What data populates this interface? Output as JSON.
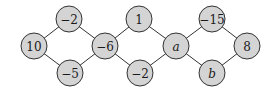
{
  "diagram": {
    "title": "",
    "node_fill": "#d4d4d4",
    "node_stroke": "#333333",
    "nodes": [
      {
        "id": "n10",
        "label": "10",
        "italic": false
      },
      {
        "id": "nm2a",
        "label": "−2",
        "italic": false
      },
      {
        "id": "nm5",
        "label": "−5",
        "italic": false
      },
      {
        "id": "nm6",
        "label": "−6",
        "italic": false
      },
      {
        "id": "n1",
        "label": "1",
        "italic": false
      },
      {
        "id": "nm2b",
        "label": "−2",
        "italic": false
      },
      {
        "id": "na",
        "label": "a",
        "italic": true
      },
      {
        "id": "nm15",
        "label": "−15",
        "italic": false
      },
      {
        "id": "nb",
        "label": "b",
        "italic": true
      },
      {
        "id": "n8",
        "label": "8",
        "italic": false
      }
    ],
    "edges": [
      [
        "n10",
        "nm2a"
      ],
      [
        "n10",
        "nm5"
      ],
      [
        "nm2a",
        "nm6"
      ],
      [
        "nm5",
        "nm6"
      ],
      [
        "nm6",
        "n1"
      ],
      [
        "nm6",
        "nm2b"
      ],
      [
        "n1",
        "na"
      ],
      [
        "nm2b",
        "na"
      ],
      [
        "na",
        "nm15"
      ],
      [
        "na",
        "nb"
      ],
      [
        "nm15",
        "n8"
      ],
      [
        "nb",
        "n8"
      ]
    ]
  }
}
